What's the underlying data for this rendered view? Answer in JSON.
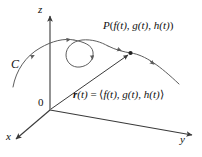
{
  "figure": {
    "kind": "3d-space-curve-diagram",
    "background_color": "#ffffff",
    "stroke_color": "#4a4a4a",
    "text_color": "#111111",
    "width": 202,
    "height": 157,
    "labels": {
      "axis_z": "z",
      "axis_y": "y",
      "axis_x": "x",
      "curve_name": "C",
      "origin": "0",
      "point_p": "P(f(t), g(t), h(t))",
      "point_p_parts": {
        "name": "P",
        "open": "(",
        "component_1": "f(t)",
        "sep_1": ", ",
        "component_2": "g(t)",
        "sep_2": ", ",
        "component_3": "h(t)",
        "close": ")"
      },
      "vector_equation": "r(t) = ⟨f(t), g(t), h(t)⟩",
      "vector_equation_parts": {
        "vector_symbol": "r",
        "argument": "(t)",
        "equals": " = ",
        "open_angle": "⟨",
        "component_1": "f(t)",
        "sep_1": ", ",
        "component_2": "g(t)",
        "sep_2": ", ",
        "component_3": "h(t)",
        "close_angle": "⟩"
      }
    },
    "axes": {
      "origin_point": [
        50,
        110
      ],
      "z_axis_tip": [
        50,
        14
      ],
      "y_axis_tip": [
        194,
        136
      ],
      "x_axis_tip": [
        14,
        141
      ]
    },
    "curve": {
      "description": "space curve C with a loop, passing through point P",
      "arrow_count": 5,
      "point_marker": {
        "label_ref": "point_p",
        "position": [
          130,
          53
        ]
      }
    },
    "position_vector": {
      "from": [
        50,
        110
      ],
      "to": [
        130,
        53
      ]
    }
  }
}
